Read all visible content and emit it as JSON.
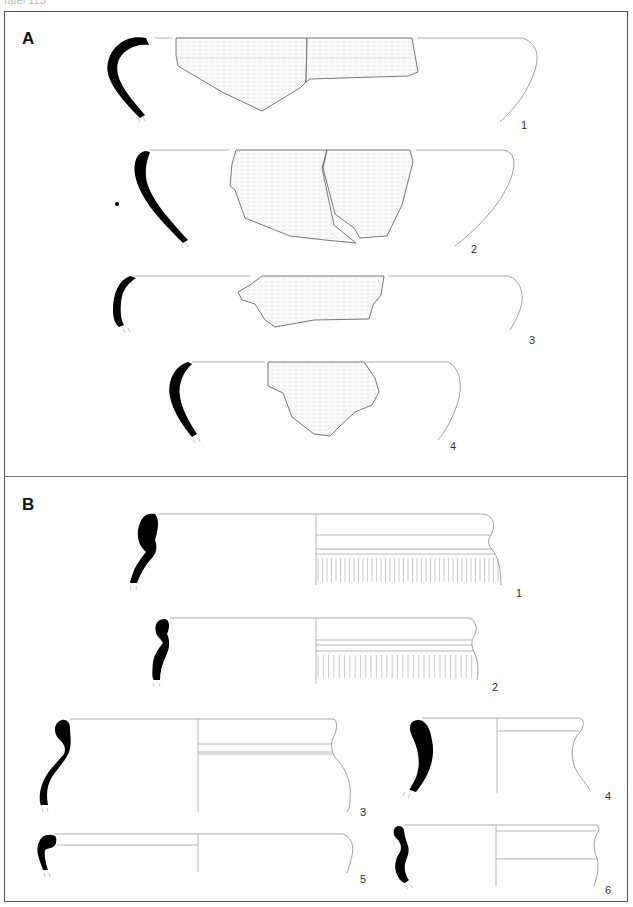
{
  "header": {
    "text": "Tafel 113"
  },
  "sections": [
    {
      "label": "A",
      "figures": [
        {
          "number": "1"
        },
        {
          "number": "2"
        },
        {
          "number": "3"
        },
        {
          "number": "4"
        }
      ]
    },
    {
      "label": "B",
      "figures": [
        {
          "number": "1"
        },
        {
          "number": "2"
        },
        {
          "number": "3"
        },
        {
          "number": "4"
        },
        {
          "number": "5"
        },
        {
          "number": "6"
        }
      ]
    }
  ]
}
